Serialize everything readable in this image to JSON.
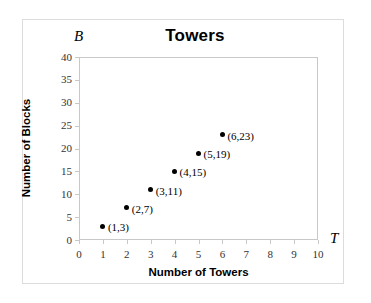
{
  "chart_data": {
    "type": "scatter",
    "title": "Towers",
    "xlabel": "Number of Towers",
    "ylabel": "Number of Blocks",
    "x_axis_symbol": "T",
    "y_axis_symbol": "B",
    "xlim": [
      0,
      10
    ],
    "ylim": [
      0,
      40
    ],
    "x_ticks": [
      0,
      1,
      2,
      3,
      4,
      5,
      6,
      7,
      8,
      9,
      10
    ],
    "y_ticks": [
      0,
      5,
      10,
      15,
      20,
      25,
      30,
      35,
      40
    ],
    "x_tick_labels": [
      "0",
      "1",
      "2",
      "3",
      "4",
      "5",
      "6",
      "7",
      "8",
      "9",
      "10"
    ],
    "y_tick_labels": [
      "0",
      "5",
      "10",
      "15",
      "20",
      "25",
      "30",
      "35",
      "40"
    ],
    "grid": false,
    "legend": false,
    "marker_color": "#000000",
    "frame_color": "#c8c8c8",
    "x": [
      1,
      2,
      3,
      4,
      5,
      6
    ],
    "values": [
      3,
      7,
      11,
      15,
      19,
      23
    ],
    "points": [
      {
        "x": 1,
        "y": 3,
        "label": "(1,3)"
      },
      {
        "x": 2,
        "y": 7,
        "label": "(2,7)"
      },
      {
        "x": 3,
        "y": 11,
        "label": "(3,11)"
      },
      {
        "x": 4,
        "y": 15,
        "label": "(4,15)"
      },
      {
        "x": 5,
        "y": 19,
        "label": "(5,19)"
      },
      {
        "x": 6,
        "y": 23,
        "label": "(6,23)"
      }
    ]
  }
}
